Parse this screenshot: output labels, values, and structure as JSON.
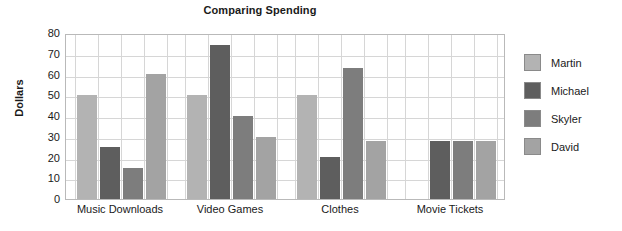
{
  "chart_data": {
    "type": "bar",
    "title": "Comparing Spending",
    "xlabel": "",
    "ylabel": "Dollars",
    "ylim": [
      0,
      80
    ],
    "ytick_step": 10,
    "yticks": [
      80,
      70,
      60,
      50,
      40,
      30,
      20,
      10,
      0
    ],
    "grid": true,
    "legend_position": "right",
    "categories": [
      "Music Downloads",
      "Video Games",
      "Clothes",
      "Movie Tickets"
    ],
    "series": [
      {
        "name": "Martin",
        "color": "#b3b3b3",
        "values": [
          50,
          50,
          50,
          0
        ]
      },
      {
        "name": "Michael",
        "color": "#5e5e5e",
        "values": [
          25,
          74,
          20,
          28
        ]
      },
      {
        "name": "Skyler",
        "color": "#7d7d7d",
        "values": [
          15,
          40,
          63,
          28
        ]
      },
      {
        "name": "David",
        "color": "#a3a3a3",
        "values": [
          60,
          30,
          28,
          28
        ]
      }
    ]
  },
  "colors": {
    "plot_border": "#b9b9b9",
    "gridline": "#d6d6d6",
    "text": "#1a1a1a",
    "background": "#ffffff"
  }
}
